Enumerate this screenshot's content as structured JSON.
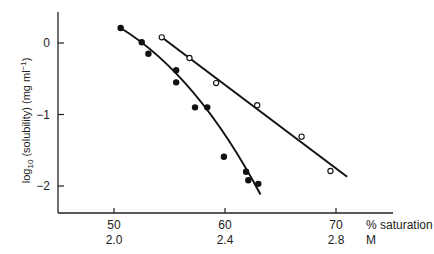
{
  "chart_data": {
    "type": "scatter",
    "title": "",
    "xlabel": "% saturation",
    "xlabel2": "M",
    "ylabel": "log10 (solubility) (mg ml-1)",
    "xlim": [
      45,
      72
    ],
    "ylim": [
      -2.4,
      0.45
    ],
    "grid": false,
    "x_ticks": [
      {
        "value": 50,
        "label": "50",
        "label2": "2.0"
      },
      {
        "value": 60,
        "label": "60",
        "label2": "2.4"
      },
      {
        "value": 70,
        "label": "70",
        "label2": "2.8"
      }
    ],
    "y_ticks": [
      {
        "value": 0,
        "label": "0"
      },
      {
        "value": -1,
        "label": "−1"
      },
      {
        "value": -2,
        "label": "−2"
      }
    ],
    "series": [
      {
        "name": "filled",
        "marker": "filled-circle",
        "fit": "curve",
        "points": [
          [
            50.6,
            0.21
          ],
          [
            52.5,
            0.01
          ],
          [
            53.1,
            -0.15
          ],
          [
            55.6,
            -0.38
          ],
          [
            55.6,
            -0.55
          ],
          [
            57.3,
            -0.9
          ],
          [
            58.4,
            -0.9
          ],
          [
            59.9,
            -1.59
          ],
          [
            61.9,
            -1.8
          ],
          [
            62.1,
            -1.92
          ],
          [
            63.0,
            -1.97
          ]
        ]
      },
      {
        "name": "open",
        "marker": "open-circle",
        "fit": "line",
        "points": [
          [
            54.3,
            0.08
          ],
          [
            56.8,
            -0.21
          ],
          [
            59.2,
            -0.56
          ],
          [
            62.9,
            -0.87
          ],
          [
            66.9,
            -1.31
          ],
          [
            69.5,
            -1.79
          ]
        ]
      }
    ]
  },
  "labels": {
    "ylabel_pre": "log",
    "ylabel_sub": "10",
    "ylabel_post": " (solubility) (mg ml",
    "ylabel_sup": "−1",
    "ylabel_end": ")",
    "x_unit1": "% saturation",
    "x_unit2": "M"
  }
}
